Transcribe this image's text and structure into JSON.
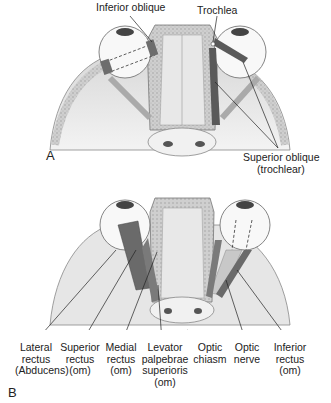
{
  "panel_a": {
    "letter": "A",
    "labels": {
      "inferior_oblique": "Inferior oblique",
      "trochlea": "Trochlea",
      "superior_oblique_1": "Superior oblique",
      "superior_oblique_2": "(trochlear)"
    }
  },
  "panel_b": {
    "letter": "B",
    "labels": [
      {
        "lines": [
          "Lateral",
          "rectus",
          "(Abducens)"
        ]
      },
      {
        "lines": [
          "Superior",
          "rectus",
          "(om)"
        ]
      },
      {
        "lines": [
          "Medial",
          "rectus",
          "(om)"
        ]
      },
      {
        "lines": [
          "Levator",
          "palpebrae",
          "superioris",
          "(om)"
        ]
      },
      {
        "lines": [
          "Optic",
          "chiasm"
        ]
      },
      {
        "lines": [
          "Optic",
          "nerve"
        ]
      },
      {
        "lines": [
          "Inferior",
          "rectus",
          "(om)"
        ]
      }
    ]
  }
}
